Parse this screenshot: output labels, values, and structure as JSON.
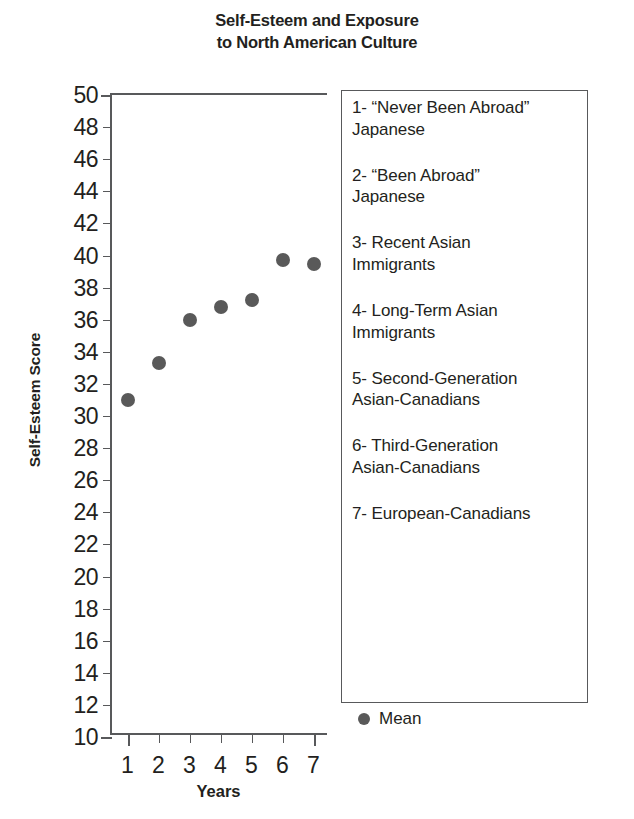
{
  "title": {
    "line1": "Self-Esteem and Exposure",
    "line2": "to North American Culture"
  },
  "axes": {
    "y_label": "Self-Esteem Score",
    "x_label": "Years"
  },
  "legend": {
    "entries": [
      "1- “Never Been Abroad”\n    Japanese",
      "2- “Been Abroad”\n    Japanese",
      "3- Recent Asian\n    Immigrants",
      "4- Long-Term Asian\n    Immigrants",
      "5- Second-Generation\n    Asian-Canadians",
      "6- Third-Generation\n    Asian-Canadians",
      "7- European-Canadians"
    ],
    "mean_label": "Mean",
    "marker_color": "#595959"
  },
  "chart_data": {
    "type": "scatter",
    "title": "Self-Esteem and Exposure to North American Culture",
    "xlabel": "Years",
    "ylabel": "Self-Esteem Score",
    "xlim": [
      0.5,
      7.5
    ],
    "ylim": [
      10,
      50
    ],
    "ytick_step": 2,
    "grid": false,
    "legend_position": "right",
    "categories": [
      "1",
      "2",
      "3",
      "4",
      "5",
      "6",
      "7"
    ],
    "x": [
      1,
      2,
      3,
      4,
      5,
      6,
      7
    ],
    "y_tick_labels": [
      "50",
      "48",
      "46",
      "44",
      "42",
      "40",
      "38",
      "36",
      "34",
      "32",
      "30",
      "28",
      "26",
      "24",
      "22",
      "20",
      "18",
      "16",
      "14",
      "12",
      "10"
    ],
    "x_tick_labels": [
      "1",
      "2",
      "3",
      "4",
      "5",
      "6",
      "7"
    ],
    "series": [
      {
        "name": "Mean",
        "values": [
          31.0,
          33.3,
          36.0,
          36.8,
          37.2,
          39.7,
          39.5
        ],
        "marker": "circle",
        "color": "#595959"
      }
    ],
    "group_names": [
      "“Never Been Abroad” Japanese",
      "“Been Abroad” Japanese",
      "Recent Asian Immigrants",
      "Long-Term Asian Immigrants",
      "Second-Generation Asian-Canadians",
      "Third-Generation Asian-Canadians",
      "European-Canadians"
    ]
  }
}
